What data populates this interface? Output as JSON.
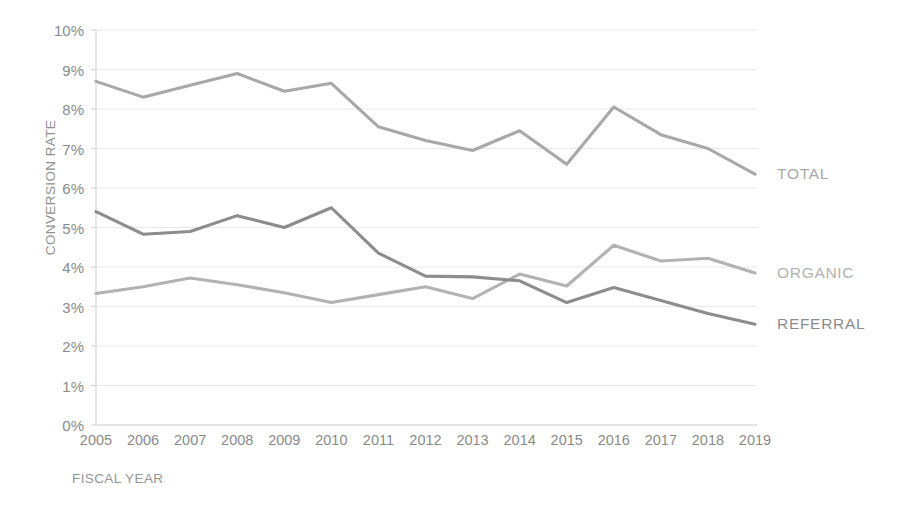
{
  "chart_data": {
    "type": "line",
    "title": "",
    "xlabel": "FISCAL YEAR",
    "ylabel": "CONVERSION RATE",
    "categories": [
      2005,
      2006,
      2007,
      2008,
      2009,
      2010,
      2011,
      2012,
      2013,
      2014,
      2015,
      2016,
      2017,
      2018,
      2019
    ],
    "x_tick_labels": [
      "2005",
      "2006",
      "2007",
      "2008",
      "2009",
      "2010",
      "2011",
      "2012",
      "2013",
      "2014",
      "2015",
      "2016",
      "2017",
      "2018",
      "2019"
    ],
    "y_tick_labels": [
      "0%",
      "1%",
      "2%",
      "3%",
      "4%",
      "5%",
      "6%",
      "7%",
      "8%",
      "9%",
      "10%"
    ],
    "y_tick_values": [
      0,
      1,
      2,
      3,
      4,
      5,
      6,
      7,
      8,
      9,
      10
    ],
    "ylim": [
      0,
      10
    ],
    "y_unit": "%",
    "grid": true,
    "legend_position": "line-end-labels",
    "series": [
      {
        "name": "TOTAL",
        "color": "#a8a8a8",
        "end_label": "TOTAL",
        "values": [
          8.7,
          8.3,
          8.6,
          8.9,
          8.45,
          8.65,
          7.55,
          7.2,
          6.95,
          7.45,
          6.6,
          8.05,
          7.35,
          7.0,
          6.35
        ]
      },
      {
        "name": "ORGANIC",
        "color": "#b2b2b2",
        "end_label": "ORGANIC",
        "values": [
          3.33,
          3.5,
          3.72,
          3.55,
          3.35,
          3.1,
          3.3,
          3.5,
          3.2,
          3.82,
          3.52,
          4.55,
          4.15,
          4.22,
          3.85
        ]
      },
      {
        "name": "REFERRAL",
        "color": "#8c8c8c",
        "end_label": "REFERRAL",
        "values": [
          5.4,
          4.83,
          4.9,
          5.3,
          5.0,
          5.5,
          4.35,
          3.77,
          3.75,
          3.65,
          3.1,
          3.48,
          3.15,
          2.82,
          2.55
        ]
      }
    ]
  },
  "axis": {
    "y_title": "CONVERSION RATE",
    "x_title": "FISCAL YEAR"
  },
  "colors": {
    "total": "#a8a8a8",
    "organic": "#b2b2b2",
    "referral": "#8c8c8c",
    "axis": "#d6d6d6",
    "grid": "#e8e8e8",
    "text": "#8a8a8a",
    "background": "#ffffff"
  }
}
